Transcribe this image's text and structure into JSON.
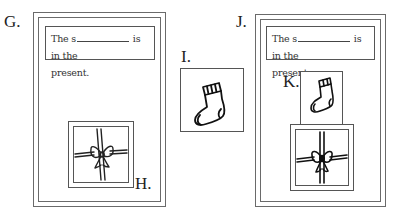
{
  "worksheet": {
    "panels": [
      {
        "id": "G",
        "label": "G.",
        "sentence_start": "The s",
        "sentence_end": " is in the",
        "sentence_line2": "present.",
        "image": "gift-icon",
        "image_label": "H."
      },
      {
        "id": "I",
        "label": "I.",
        "image": "sock-icon"
      },
      {
        "id": "J",
        "label": "J.",
        "sentence_start": "The s",
        "sentence_end": " is in the",
        "sentence_line2": "present.",
        "sock_label": "K.",
        "images": [
          "sock-icon",
          "gift-icon"
        ]
      }
    ]
  },
  "colors": {
    "line": "#555555",
    "frame": "#6a6a6a",
    "text": "#222222",
    "background": "#ffffff"
  }
}
